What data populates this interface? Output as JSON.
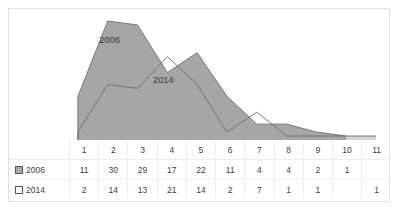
{
  "chart_data": {
    "type": "area",
    "title": "",
    "xlabel": "",
    "ylabel": "",
    "categories": [
      "1",
      "2",
      "3",
      "4",
      "5",
      "6",
      "7",
      "8",
      "9",
      "10",
      "11"
    ],
    "ylim": [
      0,
      30
    ],
    "grid": false,
    "legend_position": "data-table",
    "annotations": [
      {
        "text": "2006",
        "category": "2"
      },
      {
        "text": "2014",
        "category": "4"
      }
    ],
    "series": [
      {
        "name": "2006",
        "marker": "filled-gray-square",
        "color": "#a6a6a6",
        "values": [
          11,
          30,
          29,
          17,
          22,
          11,
          4,
          4,
          2,
          1,
          null
        ],
        "labels": [
          "11",
          "30",
          "29",
          "17",
          "22",
          "11",
          "4",
          "4",
          "2",
          "1",
          ""
        ]
      },
      {
        "name": "2014",
        "marker": "white-square",
        "color": "#d4d4d4",
        "values": [
          2,
          14,
          13,
          21,
          14,
          2,
          7,
          1,
          1,
          null,
          1
        ],
        "labels": [
          "2",
          "14",
          "13",
          "21",
          "14",
          "2",
          "7",
          "1",
          "1",
          "",
          "1"
        ]
      }
    ]
  },
  "colors": {
    "series_2006": "#a6a6a6",
    "series_2014": "#d4d4d4",
    "series_2014_front": "#ffffff",
    "outline": "#6e6e6e",
    "frame": "#e2e2e2",
    "grid": "#ededed",
    "text": "#3c3c3c"
  },
  "data_table": {
    "header_label": "",
    "rows": [
      {
        "name": "2006",
        "marker": "filled-gray-square"
      },
      {
        "name": "2014",
        "marker": "white-square"
      }
    ]
  }
}
